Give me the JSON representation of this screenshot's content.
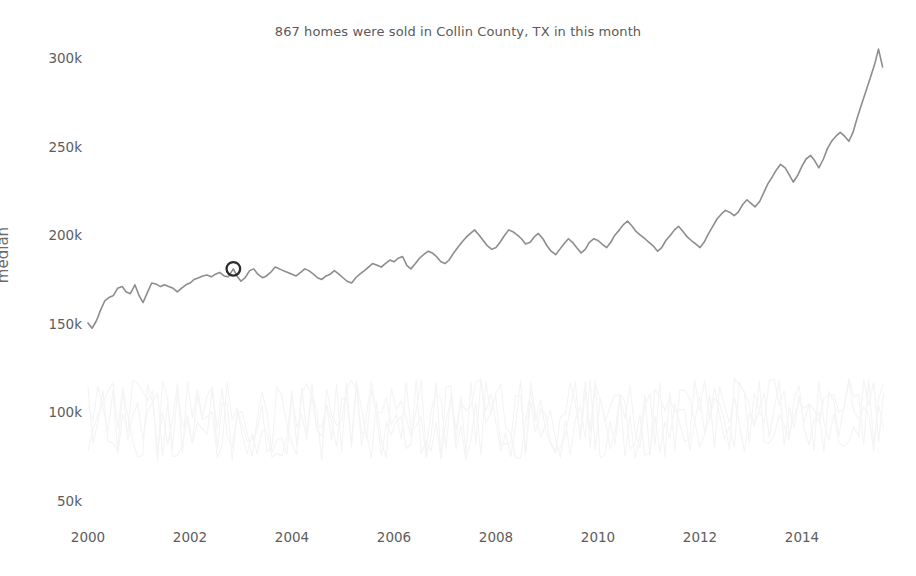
{
  "chart_data": {
    "type": "line",
    "title": "867 homes were sold in Collin County, TX in this month",
    "xlabel": "",
    "ylabel": "median",
    "grid": false,
    "legend": "none",
    "xlim": [
      2000.0,
      2015.6
    ],
    "ylim": [
      50000,
      312000
    ],
    "ytick_labels": [
      "300k",
      "250k",
      "200k",
      "150k",
      "100k",
      "50k"
    ],
    "ytick_values": [
      300000,
      250000,
      200000,
      150000,
      100000,
      50000
    ],
    "xtick_labels": [
      "2000",
      "2002",
      "2004",
      "2006",
      "2008",
      "2010",
      "2012",
      "2014"
    ],
    "xtick_values": [
      2000,
      2002,
      2004,
      2006,
      2008,
      2010,
      2012,
      2014
    ],
    "annotation": {
      "label": "highlighted-month-marker",
      "x": 2002.85,
      "y": 181000,
      "marker": "open-circle",
      "color": "#2b2b2b"
    },
    "series": [
      {
        "name": "median",
        "color": "#8d8d8d",
        "x": [
          2000.0,
          2000.08,
          2000.17,
          2000.25,
          2000.33,
          2000.42,
          2000.5,
          2000.58,
          2000.67,
          2000.75,
          2000.83,
          2000.92,
          2001.0,
          2001.08,
          2001.17,
          2001.25,
          2001.33,
          2001.42,
          2001.5,
          2001.58,
          2001.67,
          2001.75,
          2001.83,
          2001.92,
          2002.0,
          2002.08,
          2002.17,
          2002.25,
          2002.33,
          2002.42,
          2002.5,
          2002.58,
          2002.67,
          2002.75,
          2002.85,
          2002.92,
          2003.0,
          2003.08,
          2003.17,
          2003.25,
          2003.33,
          2003.42,
          2003.5,
          2003.58,
          2003.67,
          2003.75,
          2003.83,
          2003.92,
          2004.0,
          2004.08,
          2004.17,
          2004.25,
          2004.33,
          2004.42,
          2004.5,
          2004.58,
          2004.67,
          2004.75,
          2004.83,
          2004.92,
          2005.0,
          2005.08,
          2005.17,
          2005.25,
          2005.33,
          2005.42,
          2005.5,
          2005.58,
          2005.67,
          2005.75,
          2005.83,
          2005.92,
          2006.0,
          2006.08,
          2006.17,
          2006.25,
          2006.33,
          2006.42,
          2006.5,
          2006.58,
          2006.67,
          2006.75,
          2006.83,
          2006.92,
          2007.0,
          2007.08,
          2007.17,
          2007.25,
          2007.33,
          2007.42,
          2007.5,
          2007.58,
          2007.67,
          2007.75,
          2007.83,
          2007.92,
          2008.0,
          2008.08,
          2008.17,
          2008.25,
          2008.33,
          2008.42,
          2008.5,
          2008.58,
          2008.67,
          2008.75,
          2008.83,
          2008.92,
          2009.0,
          2009.08,
          2009.17,
          2009.25,
          2009.33,
          2009.42,
          2009.5,
          2009.58,
          2009.67,
          2009.75,
          2009.83,
          2009.92,
          2010.0,
          2010.08,
          2010.17,
          2010.25,
          2010.33,
          2010.42,
          2010.5,
          2010.58,
          2010.67,
          2010.75,
          2010.83,
          2010.92,
          2011.0,
          2011.08,
          2011.17,
          2011.25,
          2011.33,
          2011.42,
          2011.5,
          2011.58,
          2011.67,
          2011.75,
          2011.83,
          2011.92,
          2012.0,
          2012.08,
          2012.17,
          2012.25,
          2012.33,
          2012.42,
          2012.5,
          2012.58,
          2012.67,
          2012.75,
          2012.83,
          2012.92,
          2013.0,
          2013.08,
          2013.17,
          2013.25,
          2013.33,
          2013.42,
          2013.5,
          2013.58,
          2013.67,
          2013.75,
          2013.83,
          2013.92,
          2014.0,
          2014.08,
          2014.17,
          2014.25,
          2014.33,
          2014.42,
          2014.5,
          2014.58,
          2014.67,
          2014.75,
          2014.83,
          2014.92,
          2015.0,
          2015.08,
          2015.17,
          2015.25,
          2015.33,
          2015.42,
          2015.5,
          2015.58
        ],
        "y": [
          150500,
          147500,
          152000,
          158000,
          163000,
          165000,
          166000,
          170000,
          171000,
          168000,
          167000,
          172000,
          166000,
          162000,
          168000,
          173000,
          172500,
          171000,
          172000,
          171000,
          170000,
          168000,
          170000,
          172000,
          173000,
          175000,
          176000,
          177000,
          177500,
          176500,
          178000,
          179000,
          177000,
          176500,
          181000,
          177000,
          174000,
          176000,
          180000,
          181000,
          178000,
          176000,
          177000,
          179000,
          182000,
          181000,
          180000,
          179000,
          178000,
          177000,
          179000,
          181000,
          180000,
          178000,
          176000,
          175000,
          177000,
          178000,
          180000,
          178000,
          176000,
          174000,
          173000,
          176000,
          178000,
          180000,
          182000,
          184000,
          183000,
          182000,
          184000,
          186000,
          185000,
          187000,
          188000,
          183000,
          181000,
          184000,
          187000,
          189000,
          191000,
          190000,
          188000,
          185000,
          184000,
          186000,
          190000,
          193000,
          196000,
          199000,
          201000,
          203000,
          200000,
          197000,
          194000,
          192000,
          193000,
          196000,
          200000,
          203000,
          202000,
          200000,
          198000,
          195000,
          196000,
          199000,
          201000,
          198000,
          194000,
          191000,
          189000,
          192000,
          195000,
          198000,
          196000,
          193000,
          190000,
          192000,
          196000,
          198000,
          197000,
          195000,
          193000,
          196000,
          200000,
          203000,
          206000,
          208000,
          205000,
          202000,
          200000,
          198000,
          196000,
          194000,
          191000,
          193000,
          197000,
          200000,
          203000,
          205000,
          202000,
          199000,
          197000,
          195000,
          193000,
          196000,
          201000,
          205000,
          209000,
          212000,
          214000,
          213000,
          211000,
          213000,
          217000,
          220000,
          218000,
          216000,
          219000,
          224000,
          229000,
          233000,
          237000,
          240000,
          238000,
          234000,
          230000,
          234000,
          239000,
          243000,
          245000,
          242000,
          238000,
          243000,
          249000,
          253000,
          256000,
          258000,
          256000,
          253000,
          258000,
          266000,
          274000,
          281000,
          288000,
          296000,
          305000,
          295000
        ]
      },
      {
        "name": "background-ghost-series",
        "color": "#f4f4f6",
        "note": "very faint de-emphasized background traces",
        "x": [
          2000.0,
          2003.0,
          2006.0,
          2009.0,
          2012.0,
          2015.5
        ],
        "y": [
          95000,
          92000,
          96000,
          93000,
          98000,
          97000
        ]
      }
    ]
  }
}
